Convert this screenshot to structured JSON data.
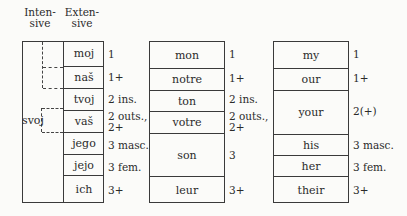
{
  "headers": {
    "intensive": "Inten-\nsive",
    "intensive_l1": "Inten-",
    "intensive_l2": "sive",
    "extensive_l1": "Exten-",
    "extensive_l2": "sive"
  },
  "czech": {
    "intensive_form": "svoj",
    "rows": [
      {
        "word": "moj",
        "gloss": [
          "1"
        ]
      },
      {
        "word": "naš",
        "gloss": [
          "1+"
        ]
      },
      {
        "word": "tvoj",
        "gloss": [
          "2 ins."
        ]
      },
      {
        "word": "vaš",
        "gloss": [
          "2 outs.,",
          "2+"
        ]
      },
      {
        "word": "jego",
        "gloss": [
          "3 masc."
        ]
      },
      {
        "word": "jejo",
        "gloss": [
          "3 fem."
        ]
      },
      {
        "word": "ich",
        "gloss": [
          "3+"
        ]
      }
    ]
  },
  "french": {
    "rows": [
      {
        "word": "mon",
        "gloss": [
          "1"
        ]
      },
      {
        "word": "notre",
        "gloss": [
          "1+"
        ]
      },
      {
        "word": "ton",
        "gloss": [
          "2 ins."
        ]
      },
      {
        "word": "votre",
        "gloss": [
          "2 outs.,",
          "2+"
        ]
      },
      {
        "word": "son",
        "gloss": [
          "3"
        ]
      },
      {
        "word": "leur",
        "gloss": [
          "3+"
        ]
      }
    ]
  },
  "english": {
    "rows": [
      {
        "word": "my",
        "gloss": [
          "1"
        ]
      },
      {
        "word": "our",
        "gloss": [
          "1+"
        ]
      },
      {
        "word": "your",
        "gloss": [
          "2(+)"
        ]
      },
      {
        "word": "his",
        "gloss": [
          "3 masc."
        ]
      },
      {
        "word": "her",
        "gloss": [
          "3 fem."
        ]
      },
      {
        "word": "their",
        "gloss": [
          "3+"
        ]
      }
    ]
  }
}
